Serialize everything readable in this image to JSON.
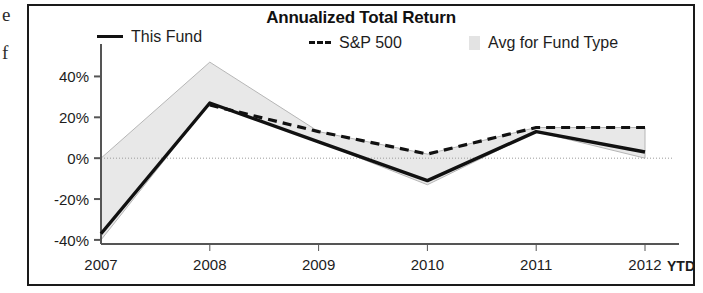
{
  "margin_text": {
    "glyph_1": "e",
    "glyph_2": "f"
  },
  "chart": {
    "title": "Annualized Total Return",
    "legend": [
      {
        "label": "This Fund",
        "marker": "solid-line-swatch",
        "color": "#111111"
      },
      {
        "label": "S&P 500",
        "marker": "dashed-line-swatch",
        "color": "#111111"
      },
      {
        "label": "Avg for Fund Type",
        "marker": "area-swatch",
        "color": "#e3e3e3"
      }
    ],
    "x_axis_suffix": "YTD",
    "colors": {
      "this_fund": "#111111",
      "sp500": "#111111",
      "avg_fund_type_fill": "#e8e8e8",
      "avg_fund_type_stroke": "#b6b6b6",
      "axis": "#555555",
      "frame": "#1a1a1a"
    }
  },
  "chart_data": {
    "type": "line",
    "title": "Annualized Total Return",
    "xlabel": "",
    "ylabel": "",
    "categories": [
      "2007",
      "2008",
      "2009",
      "2010",
      "2011",
      "2012"
    ],
    "x_tick_labels": [
      "2007",
      "2008",
      "2009",
      "2010",
      "2011",
      "2012"
    ],
    "y_tick_labels": [
      "40%",
      "20%",
      "0%",
      "-20%",
      "-40%"
    ],
    "y_ticks": [
      40,
      20,
      0,
      -20,
      -40
    ],
    "ylim": [
      -42,
      50
    ],
    "grid": false,
    "legend_position": "top",
    "series": [
      {
        "name": "This Fund",
        "style": "solid",
        "values": [
          -37,
          27,
          8,
          -11,
          13,
          3
        ]
      },
      {
        "name": "S&P 500",
        "style": "dashed",
        "values": [
          null,
          26,
          13,
          2,
          15,
          15
        ]
      },
      {
        "name": "Avg for Fund Type",
        "style": "band",
        "upper": [
          0,
          47,
          13,
          2,
          15,
          15
        ],
        "lower": [
          -40,
          27,
          8,
          -13,
          13,
          0
        ]
      }
    ]
  }
}
